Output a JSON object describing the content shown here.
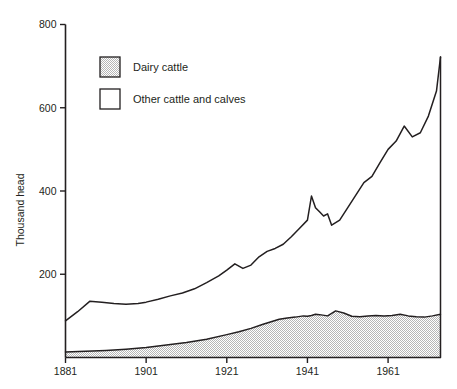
{
  "chart_data": {
    "type": "area",
    "title": "",
    "xlabel": "",
    "ylabel": "Thousand head",
    "xlim": [
      1881,
      1974
    ],
    "ylim": [
      0,
      800
    ],
    "xticks": [
      1881,
      1901,
      1921,
      1941,
      1961
    ],
    "yticks": [
      200,
      400,
      600,
      800
    ],
    "grid": false,
    "legend_position": "upper-left-inside",
    "legend": [
      {
        "label": "Dairy cattle",
        "fill": "stipple"
      },
      {
        "label": "Other cattle and calves",
        "fill": "white"
      }
    ],
    "series": [
      {
        "name": "Dairy cattle",
        "fill": "stipple",
        "x": [
          1881,
          1886,
          1891,
          1896,
          1901,
          1906,
          1911,
          1916,
          1921,
          1924,
          1927,
          1930,
          1932,
          1934,
          1936,
          1938,
          1940,
          1941,
          1942,
          1943,
          1944,
          1946,
          1948,
          1950,
          1952,
          1954,
          1956,
          1958,
          1960,
          1962,
          1964,
          1966,
          1968,
          1970,
          1972,
          1974
        ],
        "values": [
          13,
          15,
          17,
          20,
          24,
          30,
          36,
          44,
          55,
          62,
          70,
          80,
          86,
          92,
          95,
          97,
          100,
          99,
          101,
          104,
          103,
          100,
          112,
          107,
          99,
          98,
          100,
          101,
          100,
          101,
          104,
          100,
          98,
          97,
          100,
          104
        ]
      },
      {
        "name": "Total cattle (dairy + other cattle and calves)",
        "fill": "white",
        "x": [
          1881,
          1884,
          1887,
          1890,
          1893,
          1896,
          1899,
          1901,
          1904,
          1907,
          1910,
          1913,
          1916,
          1919,
          1921,
          1923,
          1925,
          1927,
          1929,
          1931,
          1933,
          1935,
          1937,
          1939,
          1941,
          1942,
          1943,
          1944,
          1945,
          1946,
          1947,
          1949,
          1951,
          1953,
          1955,
          1957,
          1959,
          1961,
          1963,
          1965,
          1967,
          1969,
          1971,
          1973,
          1974
        ],
        "values": [
          88,
          110,
          135,
          133,
          130,
          128,
          130,
          133,
          140,
          148,
          155,
          165,
          180,
          196,
          210,
          225,
          214,
          222,
          242,
          255,
          262,
          272,
          290,
          310,
          330,
          388,
          360,
          350,
          340,
          345,
          318,
          330,
          360,
          390,
          420,
          435,
          468,
          500,
          520,
          556,
          530,
          540,
          580,
          640,
          722
        ]
      }
    ],
    "annotations": []
  },
  "colors": {
    "ink": "#231f20",
    "stipple": "#d9d9d9",
    "background": "#ffffff"
  }
}
